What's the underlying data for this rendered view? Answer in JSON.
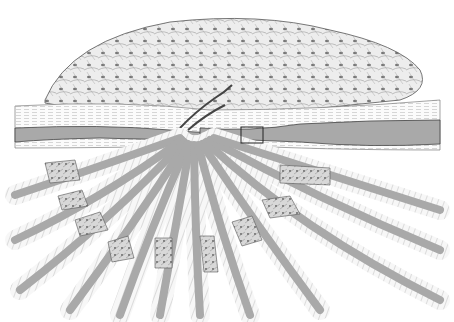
{
  "figure": {
    "colors": {
      "background": "#ffffff",
      "ink": "#2a2a2a",
      "fiber_core": "#a9a9a9",
      "sheath": "#f2f2f2",
      "dendrite_fill": "#e6e6e6",
      "patch": "#cfcfcf"
    },
    "highlight_box": {
      "x": 241,
      "y": 127,
      "width": 22,
      "height": 16
    }
  }
}
